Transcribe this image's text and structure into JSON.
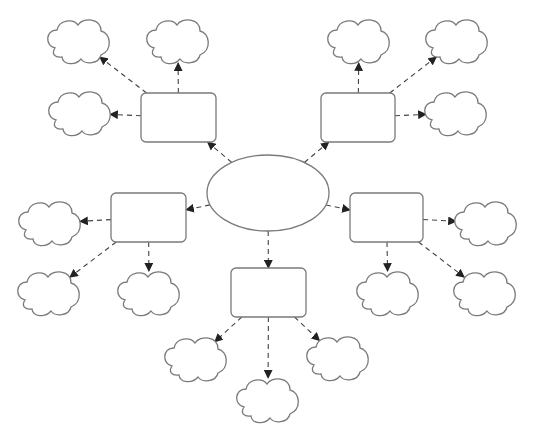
{
  "diagram": {
    "type": "mind-map / spider graphic organizer",
    "colors": {
      "background": "#ffffff",
      "shape_stroke": "#7a7a7a",
      "connector": "#444444"
    },
    "center": {
      "shape": "ellipse",
      "label": "",
      "cx": 268,
      "cy": 193,
      "rx": 61,
      "ry": 38
    },
    "branches": [
      {
        "id": "top-left",
        "box": {
          "x": 141,
          "y": 93,
          "w": 75,
          "h": 49
        },
        "label": "",
        "clouds": [
          {
            "x": 47,
            "y": 18,
            "label": ""
          },
          {
            "x": 146,
            "y": 18,
            "label": ""
          },
          {
            "x": 48,
            "y": 90,
            "label": ""
          }
        ]
      },
      {
        "id": "top-right",
        "box": {
          "x": 321,
          "y": 93,
          "w": 74,
          "h": 49
        },
        "label": "",
        "clouds": [
          {
            "x": 327,
            "y": 18,
            "label": ""
          },
          {
            "x": 425,
            "y": 18,
            "label": ""
          },
          {
            "x": 424,
            "y": 90,
            "label": ""
          }
        ]
      },
      {
        "id": "left",
        "box": {
          "x": 111,
          "y": 193,
          "w": 75,
          "h": 49
        },
        "label": "",
        "clouds": [
          {
            "x": 18,
            "y": 200,
            "label": ""
          },
          {
            "x": 17,
            "y": 270,
            "label": ""
          },
          {
            "x": 117,
            "y": 270,
            "label": ""
          }
        ]
      },
      {
        "id": "right",
        "box": {
          "x": 350,
          "y": 193,
          "w": 73,
          "h": 49
        },
        "label": "",
        "clouds": [
          {
            "x": 454,
            "y": 200,
            "label": ""
          },
          {
            "x": 356,
            "y": 270,
            "label": ""
          },
          {
            "x": 453,
            "y": 270,
            "label": ""
          }
        ]
      },
      {
        "id": "bottom",
        "box": {
          "x": 231,
          "y": 268,
          "w": 75,
          "h": 49
        },
        "label": "",
        "clouds": [
          {
            "x": 164,
            "y": 336,
            "label": ""
          },
          {
            "x": 236,
            "y": 377,
            "label": ""
          },
          {
            "x": 306,
            "y": 335,
            "label": ""
          }
        ]
      }
    ],
    "counts": {
      "center": 1,
      "boxes": 5,
      "clouds": 15,
      "arrows": 20
    }
  }
}
